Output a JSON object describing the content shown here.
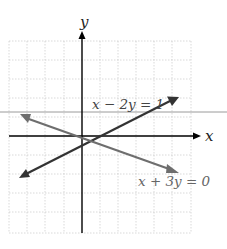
{
  "figure": {
    "axes": {
      "x_label": "x",
      "y_label": "y"
    },
    "lines": [
      {
        "equation": "x − 2y = 1",
        "color": "#333333"
      },
      {
        "equation": "x + 3y = 0",
        "color": "#6e6e6e"
      }
    ],
    "colors": {
      "grid": "#c8c8c8",
      "axis": "#000000",
      "divider": "#9a9a9a"
    }
  }
}
